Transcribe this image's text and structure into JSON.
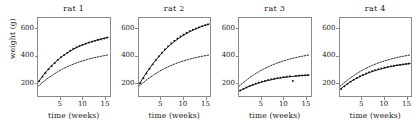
{
  "chart_data": {
    "type": "scatter",
    "title": "",
    "xlabel": "time (weeks)",
    "ylabel": "weight (g)",
    "xlim": [
      0,
      16.2
    ],
    "ylim": [
      100,
      680
    ],
    "xticks": [
      5,
      10,
      15
    ],
    "yticks": [
      200,
      400,
      600
    ],
    "grid": false,
    "legend": "none",
    "panel_layout": "1x4",
    "panels": [
      {
        "title": "rat 1",
        "observed": {
          "name": "observed weight",
          "marker": "filled-square",
          "x": [
            0.3,
            1.0,
            1.7,
            2.4,
            3.1,
            3.8,
            4.5,
            5.2,
            5.9,
            6.6,
            7.3,
            8.0,
            8.7,
            9.4,
            10.1,
            10.8,
            11.5,
            12.2,
            12.9,
            13.6,
            14.3,
            15.0,
            15.6
          ],
          "y": [
            212,
            243,
            272,
            299,
            322,
            345,
            368,
            389,
            404,
            420,
            437,
            452,
            462,
            472,
            481,
            489,
            497,
            503,
            510,
            516,
            521,
            527,
            534
          ]
        },
        "fitted": {
          "name": "individual fitted curve",
          "style": "solid",
          "x": [
            0.0,
            0.8,
            1.6,
            2.4,
            3.2,
            4.0,
            4.8,
            5.6,
            6.4,
            7.2,
            8.0,
            8.8,
            9.6,
            10.4,
            11.2,
            12.0,
            12.8,
            13.6,
            14.4,
            15.2,
            16.0
          ],
          "y": [
            200,
            238,
            272,
            302,
            329,
            354,
            377,
            397,
            415,
            432,
            447,
            461,
            473,
            484,
            494,
            503,
            511,
            518,
            525,
            531,
            537
          ]
        },
        "reference": {
          "name": "population curve",
          "style": "dashed",
          "x": [
            0.0,
            0.8,
            1.6,
            2.4,
            3.2,
            4.0,
            4.8,
            5.6,
            6.4,
            7.2,
            8.0,
            8.8,
            9.6,
            10.4,
            11.2,
            12.0,
            12.8,
            13.6,
            14.4,
            15.2,
            16.0
          ],
          "y": [
            172,
            195,
            216,
            236,
            254,
            271,
            287,
            301,
            314,
            326,
            337,
            347,
            356,
            364,
            372,
            379,
            385,
            391,
            396,
            401,
            406
          ]
        }
      },
      {
        "title": "rat 2",
        "observed": {
          "name": "observed weight",
          "marker": "filled-square",
          "x": [
            0.3,
            1.0,
            1.7,
            2.4,
            3.1,
            3.8,
            4.5,
            5.2,
            5.9,
            6.6,
            7.3,
            8.0,
            8.7,
            9.4,
            10.1,
            10.8,
            11.5,
            12.2,
            12.9,
            13.6,
            14.3,
            15.0,
            15.6
          ],
          "y": [
            196,
            232,
            268,
            302,
            335,
            366,
            395,
            422,
            447,
            470,
            491,
            510,
            527,
            543,
            557,
            570,
            582,
            593,
            602,
            611,
            619,
            626,
            632
          ]
        },
        "fitted": {
          "name": "individual fitted curve",
          "style": "solid",
          "x": [
            0.0,
            0.8,
            1.6,
            2.4,
            3.2,
            4.0,
            4.8,
            5.6,
            6.4,
            7.2,
            8.0,
            8.8,
            9.6,
            10.4,
            11.2,
            12.0,
            12.8,
            13.6,
            14.4,
            15.2,
            16.0
          ],
          "y": [
            185,
            228,
            269,
            307,
            342,
            375,
            405,
            433,
            459,
            483,
            504,
            524,
            542,
            558,
            573,
            586,
            598,
            609,
            619,
            628,
            636
          ]
        },
        "reference": {
          "name": "population curve",
          "style": "dashed",
          "x": [
            0.0,
            0.8,
            1.6,
            2.4,
            3.2,
            4.0,
            4.8,
            5.6,
            6.4,
            7.2,
            8.0,
            8.8,
            9.6,
            10.4,
            11.2,
            12.0,
            12.8,
            13.6,
            14.4,
            15.2,
            16.0
          ],
          "y": [
            172,
            195,
            216,
            236,
            254,
            271,
            287,
            301,
            314,
            326,
            337,
            347,
            356,
            364,
            372,
            379,
            385,
            391,
            396,
            401,
            406
          ]
        }
      },
      {
        "title": "rat 3",
        "observed": {
          "name": "observed weight",
          "marker": "filled-square",
          "x": [
            0.3,
            1.0,
            1.7,
            2.4,
            3.1,
            3.8,
            4.5,
            5.2,
            5.9,
            6.6,
            7.3,
            8.0,
            8.7,
            9.4,
            10.1,
            10.8,
            11.5,
            12.2,
            12.9,
            13.6,
            14.3,
            15.0,
            15.6
          ],
          "y": [
            140,
            152,
            163,
            173,
            183,
            192,
            200,
            207,
            213,
            219,
            224,
            229,
            233,
            237,
            241,
            244,
            247,
            212,
            250,
            252,
            253,
            254,
            255
          ]
        },
        "fitted": {
          "name": "individual fitted curve",
          "style": "solid",
          "x": [
            0.0,
            0.8,
            1.6,
            2.4,
            3.2,
            4.0,
            4.8,
            5.6,
            6.4,
            7.2,
            8.0,
            8.8,
            9.6,
            10.4,
            11.2,
            12.0,
            12.8,
            13.6,
            14.4,
            15.2,
            16.0
          ],
          "y": [
            137,
            150,
            162,
            173,
            183,
            192,
            200,
            208,
            214,
            220,
            226,
            231,
            235,
            239,
            242,
            245,
            248,
            250,
            252,
            254,
            256
          ]
        },
        "reference": {
          "name": "population curve",
          "style": "dashed",
          "x": [
            0.0,
            0.8,
            1.6,
            2.4,
            3.2,
            4.0,
            4.8,
            5.6,
            6.4,
            7.2,
            8.0,
            8.8,
            9.6,
            10.4,
            11.2,
            12.0,
            12.8,
            13.6,
            14.4,
            15.2,
            16.0
          ],
          "y": [
            172,
            195,
            216,
            236,
            254,
            271,
            287,
            301,
            314,
            326,
            337,
            347,
            356,
            364,
            372,
            379,
            385,
            391,
            396,
            401,
            406
          ]
        }
      },
      {
        "title": "rat 4",
        "observed": {
          "name": "observed weight",
          "marker": "filled-square",
          "x": [
            0.3,
            1.0,
            1.7,
            2.4,
            3.1,
            3.8,
            4.5,
            5.2,
            5.9,
            6.6,
            7.3,
            8.0,
            8.7,
            9.4,
            10.1,
            10.8,
            11.5,
            12.2,
            12.9,
            13.6,
            14.3,
            15.0,
            15.6
          ],
          "y": [
            152,
            172,
            190,
            206,
            221,
            234,
            246,
            257,
            267,
            276,
            284,
            292,
            299,
            305,
            311,
            316,
            321,
            325,
            329,
            332,
            335,
            338,
            341
          ]
        },
        "fitted": {
          "name": "individual fitted curve",
          "style": "solid",
          "x": [
            0.0,
            0.8,
            1.6,
            2.4,
            3.2,
            4.0,
            4.8,
            5.6,
            6.4,
            7.2,
            8.0,
            8.8,
            9.6,
            10.4,
            11.2,
            12.0,
            12.8,
            13.6,
            14.4,
            15.2,
            16.0
          ],
          "y": [
            148,
            170,
            189,
            207,
            222,
            236,
            249,
            261,
            271,
            281,
            289,
            297,
            304,
            311,
            317,
            322,
            327,
            331,
            335,
            339,
            342
          ]
        },
        "reference": {
          "name": "population curve",
          "style": "dashed",
          "x": [
            0.0,
            0.8,
            1.6,
            2.4,
            3.2,
            4.0,
            4.8,
            5.6,
            6.4,
            7.2,
            8.0,
            8.8,
            9.6,
            10.4,
            11.2,
            12.0,
            12.8,
            13.6,
            14.4,
            15.2,
            16.0
          ],
          "y": [
            172,
            195,
            216,
            236,
            254,
            271,
            287,
            301,
            314,
            326,
            337,
            347,
            356,
            364,
            372,
            379,
            385,
            391,
            396,
            401,
            406
          ]
        }
      }
    ],
    "colors": {
      "line": "#111111",
      "marker": "#111111",
      "frame": "#8a8a8a",
      "background": "#ffffff"
    }
  }
}
